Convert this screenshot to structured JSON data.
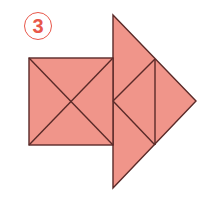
{
  "figure": {
    "label": "3",
    "colors": {
      "fill": "#f0958a",
      "stroke": "#5a2a28",
      "label": "#e8574a",
      "background": "#ffffff"
    },
    "shapes": {
      "square": {
        "x1": 29,
        "y1": 58,
        "x2": 113,
        "y2": 145
      },
      "big_triangle": {
        "top": [
          113,
          15
        ],
        "bottom": [
          113,
          188
        ],
        "apex": [
          196,
          101
        ]
      },
      "inner_vertical_x": 155
    }
  }
}
